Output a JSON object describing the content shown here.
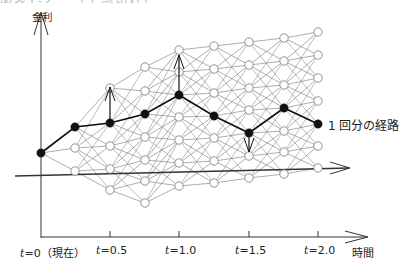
{
  "caption": "図表1-2 …（上部切れ）",
  "axes": {
    "y_label": "金利",
    "x_label": "時間",
    "x_ticks": [
      {
        "var": "t",
        "text": "=0（現在）",
        "x": 41
      },
      {
        "var": "t",
        "text": "=0.5",
        "x": 110
      },
      {
        "var": "t",
        "text": "=1.0",
        "x": 179
      },
      {
        "var": "t",
        "text": "=1.5",
        "x": 249
      },
      {
        "var": "t",
        "text": "=2.0",
        "x": 318
      }
    ]
  },
  "legend": {
    "path_label": "1 回分の経路"
  },
  "lattice": {
    "columns": [
      {
        "x": 41,
        "ys": [
          153
        ]
      },
      {
        "x": 75,
        "ys": [
          127,
          148,
          171
        ]
      },
      {
        "x": 110,
        "ys": [
          88,
          123,
          146,
          169,
          190
        ]
      },
      {
        "x": 145,
        "ys": [
          67,
          91,
          114,
          137,
          160,
          181,
          203
        ]
      },
      {
        "x": 179,
        "ys": [
          50,
          72,
          95,
          117,
          140,
          163,
          186
        ]
      },
      {
        "x": 214,
        "ys": [
          46,
          69,
          93,
          116,
          138,
          161,
          183
        ]
      },
      {
        "x": 249,
        "ys": [
          42,
          65,
          88,
          110,
          133,
          156,
          178
        ]
      },
      {
        "x": 284,
        "ys": [
          38,
          61,
          85,
          108,
          131,
          152,
          174
        ]
      },
      {
        "x": 318,
        "ys": [
          32,
          55,
          78,
          101,
          124,
          146,
          168
        ]
      }
    ],
    "path": [
      [
        41,
        153
      ],
      [
        75,
        127
      ],
      [
        110,
        123
      ],
      [
        145,
        114
      ],
      [
        179,
        95
      ],
      [
        214,
        116
      ],
      [
        249,
        133
      ],
      [
        284,
        108
      ],
      [
        318,
        124
      ]
    ],
    "arrows": [
      {
        "x": 110,
        "from": 123,
        "to": 87,
        "dir": "up"
      },
      {
        "x": 179,
        "from": 95,
        "to": 55,
        "dir": "up"
      },
      {
        "x": 249,
        "from": 133,
        "to": 152,
        "dir": "down"
      }
    ]
  },
  "colors": {
    "line": "#777777",
    "path": "#111111",
    "axis": "#333333"
  }
}
